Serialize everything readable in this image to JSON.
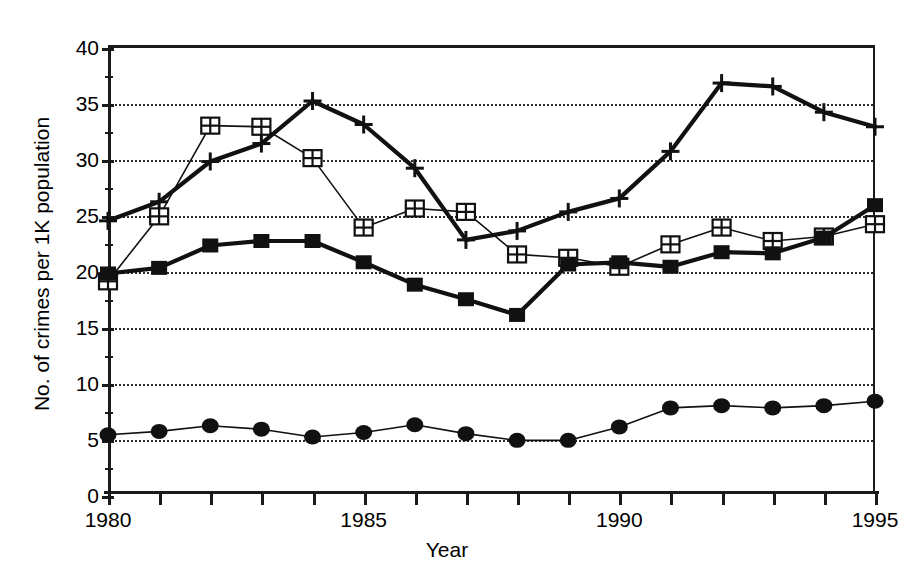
{
  "chart_data": {
    "type": "line",
    "title": "",
    "xlabel": "Year",
    "ylabel": "No. of crimes per 1K population",
    "x": [
      1980,
      1981,
      1982,
      1983,
      1984,
      1985,
      1986,
      1987,
      1988,
      1989,
      1990,
      1991,
      1992,
      1993,
      1994,
      1995
    ],
    "xlim": [
      1980,
      1995
    ],
    "ylim": [
      0,
      40
    ],
    "ytick_values": [
      0,
      5,
      10,
      15,
      20,
      25,
      30,
      35,
      40
    ],
    "ytick_labels": [
      "0",
      "5",
      "10",
      "15",
      "20",
      "25",
      "30",
      "35",
      "40"
    ],
    "yminor_step": 2.5,
    "xtick_values": [
      1980,
      1981,
      1982,
      1983,
      1984,
      1985,
      1986,
      1987,
      1988,
      1989,
      1990,
      1991,
      1992,
      1993,
      1994,
      1995
    ],
    "xtick_labels": [
      "1980",
      "",
      "",
      "",
      "",
      "1985",
      "",
      "",
      "",
      "",
      "1990",
      "",
      "",
      "",
      "",
      "1995"
    ],
    "grid": "horizontal-dotted",
    "legend": "none",
    "series": [
      {
        "name": "plus-series",
        "marker": "plus",
        "linewidth": "thick",
        "values": [
          24.3,
          26.0,
          29.6,
          31.2,
          35.0,
          32.9,
          29.0,
          22.6,
          23.4,
          25.1,
          26.3,
          30.5,
          36.6,
          36.3,
          34.0,
          32.7
        ]
      },
      {
        "name": "open-square-series",
        "marker": "crossed-square",
        "linewidth": "thin",
        "values": [
          18.9,
          24.7,
          32.8,
          32.7,
          29.9,
          23.7,
          25.4,
          25.1,
          21.3,
          21.0,
          20.2,
          22.2,
          23.7,
          22.5,
          22.9,
          24.0
        ]
      },
      {
        "name": "filled-square-series",
        "marker": "filled-square",
        "linewidth": "thick",
        "values": [
          19.6,
          20.1,
          22.1,
          22.5,
          22.5,
          20.6,
          18.6,
          17.3,
          15.9,
          20.4,
          20.6,
          20.2,
          21.5,
          21.4,
          22.8,
          25.7
        ]
      },
      {
        "name": "filled-circle-series",
        "marker": "filled-circle",
        "linewidth": "thin",
        "values": [
          5.2,
          5.5,
          6.0,
          5.7,
          5.0,
          5.4,
          6.1,
          5.3,
          4.7,
          4.7,
          5.9,
          7.6,
          7.8,
          7.6,
          7.8,
          8.2
        ]
      }
    ]
  }
}
